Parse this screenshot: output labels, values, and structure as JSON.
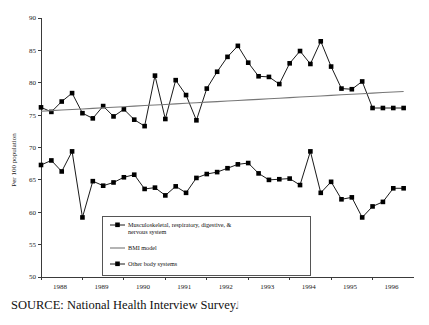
{
  "figure": {
    "source_note": "SOURCE: National Health Interview Survey.",
    "page_mark": "|"
  },
  "chart_data": {
    "type": "line",
    "title": "",
    "xlabel": "",
    "ylabel": "Per 100 population",
    "ylim": [
      50,
      90
    ],
    "xlim": [
      1988.0,
      1997.0
    ],
    "yticks": [
      50,
      55,
      60,
      65,
      70,
      75,
      80,
      85,
      90
    ],
    "ytick_labels": [
      "50",
      "55",
      "60",
      "65",
      "70",
      "75",
      "80",
      "85",
      "90"
    ],
    "xticks": [
      1988,
      1989,
      1990,
      1991,
      1992,
      1993,
      1994,
      1995,
      1996
    ],
    "xtick_labels": [
      "1988",
      "1989",
      "1990",
      "1991",
      "1992",
      "1993",
      "1994",
      "1995",
      "1996"
    ],
    "grid": false,
    "legend_position": "lower-center",
    "x": [
      1988.0,
      1988.25,
      1988.5,
      1988.75,
      1989.0,
      1989.25,
      1989.5,
      1989.75,
      1990.0,
      1990.25,
      1990.5,
      1990.75,
      1991.0,
      1991.25,
      1991.5,
      1991.75,
      1992.0,
      1992.25,
      1992.5,
      1992.75,
      1993.0,
      1993.25,
      1993.5,
      1993.75,
      1994.0,
      1994.25,
      1994.5,
      1994.75,
      1995.0,
      1995.25,
      1995.5,
      1995.75,
      1996.0,
      1996.25,
      1996.5,
      1996.75
    ],
    "series": [
      {
        "name": "Musculoskeletal, respiratory, digestive, & nervous system",
        "marker": "square",
        "values": [
          76.2,
          75.5,
          77.1,
          78.4,
          75.3,
          74.5,
          76.4,
          74.8,
          75.9,
          74.3,
          73.3,
          81.1,
          74.4,
          80.4,
          78.1,
          74.2,
          79.1,
          81.7,
          84.0,
          85.7,
          83.1,
          81.0,
          80.9,
          79.8,
          83.0,
          84.9,
          82.9,
          86.4,
          82.5,
          79.1,
          79.0,
          80.2,
          76.1,
          76.1,
          76.1,
          76.1
        ]
      },
      {
        "name": "BMI model",
        "marker": "none",
        "trend": true,
        "values": [
          75.6,
          75.69,
          75.78,
          75.86,
          75.95,
          76.04,
          76.13,
          76.21,
          76.3,
          76.39,
          76.48,
          76.56,
          76.65,
          76.74,
          76.83,
          76.91,
          77.0,
          77.09,
          77.18,
          77.26,
          77.35,
          77.44,
          77.53,
          77.61,
          77.7,
          77.79,
          77.88,
          77.96,
          78.05,
          78.14,
          78.23,
          78.31,
          78.4,
          78.49,
          78.58,
          78.66
        ]
      },
      {
        "name": "Other body systems",
        "marker": "square",
        "values": [
          67.3,
          68.0,
          66.3,
          69.4,
          59.2,
          64.8,
          64.1,
          64.6,
          65.4,
          65.8,
          63.6,
          63.8,
          62.6,
          64.0,
          63.0,
          65.3,
          65.9,
          66.2,
          66.8,
          67.4,
          67.6,
          66.0,
          65.0,
          65.1,
          65.2,
          64.2,
          69.4,
          63.0,
          64.7,
          62.0,
          62.3,
          59.2,
          60.9,
          61.6,
          63.7,
          63.7
        ]
      }
    ],
    "legend_entries": [
      {
        "label_lines": [
          "Musculoskeletal, respiratory, digestive, &",
          "nervous system"
        ],
        "marker": "square-line"
      },
      {
        "label_lines": [
          "BMI model"
        ],
        "marker": "line"
      },
      {
        "label_lines": [
          "Other body systems"
        ],
        "marker": "square-line"
      }
    ]
  }
}
